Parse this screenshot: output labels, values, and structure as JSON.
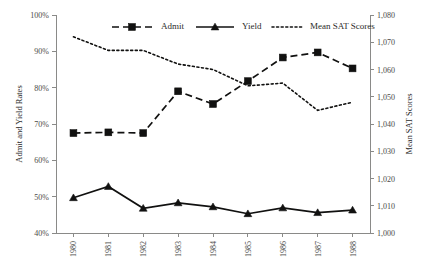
{
  "chart_data": {
    "type": "line",
    "title": "",
    "xlabel": "",
    "ylabel": "Admit and Yield Rates",
    "y2label": "Mean SAT Scores",
    "categories": [
      "1980",
      "1981",
      "1982",
      "1983",
      "1984",
      "1985",
      "1986",
      "1987",
      "1988"
    ],
    "ylim": [
      40,
      100
    ],
    "y2lim": [
      1000,
      1080
    ],
    "yticks": [
      "40%",
      "50%",
      "60%",
      "70%",
      "80%",
      "90%",
      "100%"
    ],
    "ytick_values": [
      40,
      50,
      60,
      70,
      80,
      90,
      100
    ],
    "y2ticks": [
      "1,000",
      "1,010",
      "1,020",
      "1,030",
      "1,040",
      "1,050",
      "1,060",
      "1,070",
      "1,080"
    ],
    "y2tick_values": [
      1000,
      1010,
      1020,
      1030,
      1040,
      1050,
      1060,
      1070,
      1080
    ],
    "grid": false,
    "legend_position": "top-center",
    "series": [
      {
        "name": "Admit",
        "axis": "left",
        "marker": "square",
        "linestyle": "dashed",
        "color": "#111110",
        "values": [
          67.5,
          67.7,
          67.5,
          79.0,
          75.5,
          81.8,
          88.3,
          89.7,
          85.3
        ]
      },
      {
        "name": "Yield",
        "axis": "left",
        "marker": "triangle",
        "linestyle": "solid",
        "color": "#111110",
        "values": [
          49.7,
          52.8,
          46.8,
          48.3,
          47.2,
          45.3,
          46.9,
          45.6,
          46.3
        ]
      },
      {
        "name": "Mean SAT Scores",
        "axis": "right",
        "marker": "none",
        "linestyle": "dotted",
        "color": "#111110",
        "values": [
          1072,
          1067,
          1067,
          1062,
          1060,
          1054,
          1055,
          1045,
          1048
        ]
      }
    ]
  }
}
